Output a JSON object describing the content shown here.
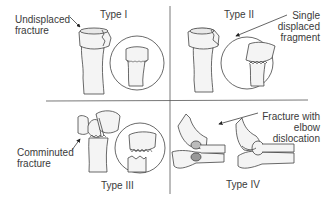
{
  "figure": {
    "quadrants": [
      {
        "id": "type-1",
        "type_label": "Type I",
        "annotation": [
          "Undisplaced",
          "fracture"
        ],
        "description": "Undisplaced fracture"
      },
      {
        "id": "type-2",
        "type_label": "Type II",
        "annotation": [
          "Single",
          "displaced",
          "fragment"
        ],
        "description": "Single displaced fragment"
      },
      {
        "id": "type-3",
        "type_label": "Type III",
        "annotation": [
          "Comminuted",
          "fracture"
        ],
        "description": "Comminuted fracture"
      },
      {
        "id": "type-4",
        "type_label": "Type IV",
        "annotation": [
          "Fracture with",
          "elbow",
          "dislocation"
        ],
        "description": "Fracture with elbow dislocation"
      }
    ],
    "colors": {
      "line": "#555555",
      "bone_fill": "#f4f4f4",
      "bone_stroke": "#444444",
      "text": "#3a3a3a"
    }
  }
}
